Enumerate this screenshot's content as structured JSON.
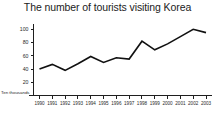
{
  "chart_data": {
    "type": "line",
    "title": "The number of tourists visiting Korea",
    "xlabel": "",
    "ylabel": "",
    "unit_label": "Ten thousands",
    "grid": false,
    "legend": false,
    "categories": [
      "1990",
      "1991",
      "1992",
      "1993",
      "1994",
      "1995",
      "1996",
      "1997",
      "1998",
      "1999",
      "2000",
      "2001",
      "2002",
      "2003"
    ],
    "values": [
      40,
      47,
      38,
      48,
      59,
      50,
      57,
      55,
      82,
      69,
      78,
      89,
      100,
      95
    ],
    "series": [
      {
        "name": "Tourists visiting Korea",
        "values": [
          40,
          47,
          38,
          48,
          59,
          50,
          57,
          55,
          82,
          69,
          78,
          89,
          100,
          95
        ]
      }
    ],
    "ylim": [
      0,
      108
    ],
    "xlim": [
      "1990",
      "2003"
    ],
    "yticks": [
      20,
      40,
      60,
      80,
      100
    ],
    "ytick_labels": [
      "20",
      "40",
      "60",
      "80",
      "100"
    ],
    "xtick_labels": [
      "1990",
      "1991",
      "1992",
      "1993",
      "1994",
      "1995",
      "1996",
      "1997",
      "1998",
      "1999",
      "2000",
      "2001",
      "2002",
      "2003"
    ],
    "line_color": "#111111"
  }
}
